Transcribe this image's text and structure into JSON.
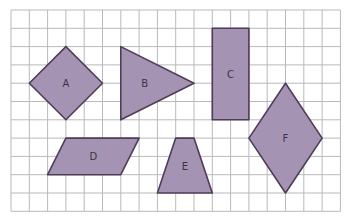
{
  "grid": {
    "origin_x": 11,
    "origin_y": 10,
    "cell": 18.3,
    "columns": 18,
    "rows": 11,
    "line_color": "#b9b9bd"
  },
  "colors": {
    "fill": "#a593b4",
    "stroke": "#4f3c58",
    "label": "#3c3440"
  },
  "shapes": [
    {
      "id": "A",
      "label": "A",
      "type": "square-rotated",
      "points": [
        [
          3,
          2
        ],
        [
          5,
          4
        ],
        [
          3,
          6
        ],
        [
          1,
          4
        ]
      ],
      "label_pos": [
        3,
        4
      ]
    },
    {
      "id": "B",
      "label": "B",
      "type": "triangle",
      "points": [
        [
          6,
          2
        ],
        [
          10,
          4
        ],
        [
          6,
          6
        ]
      ],
      "label_pos": [
        7.3,
        4
      ]
    },
    {
      "id": "C",
      "label": "C",
      "type": "rectangle",
      "points": [
        [
          11,
          1
        ],
        [
          13,
          1
        ],
        [
          13,
          6
        ],
        [
          11,
          6
        ]
      ],
      "label_pos": [
        12,
        3.5
      ]
    },
    {
      "id": "D",
      "label": "D",
      "type": "parallelogram",
      "points": [
        [
          3,
          7
        ],
        [
          7,
          7
        ],
        [
          6,
          9
        ],
        [
          2,
          9
        ]
      ],
      "label_pos": [
        4.5,
        8
      ]
    },
    {
      "id": "E",
      "label": "E",
      "type": "trapezoid",
      "points": [
        [
          9,
          7
        ],
        [
          10,
          7
        ],
        [
          11,
          10
        ],
        [
          8,
          10
        ]
      ],
      "label_pos": [
        9.5,
        8.5
      ]
    },
    {
      "id": "F",
      "label": "F",
      "type": "rhombus",
      "points": [
        [
          15,
          4
        ],
        [
          17,
          7
        ],
        [
          15,
          10
        ],
        [
          13,
          7
        ]
      ],
      "label_pos": [
        15,
        7
      ]
    }
  ]
}
